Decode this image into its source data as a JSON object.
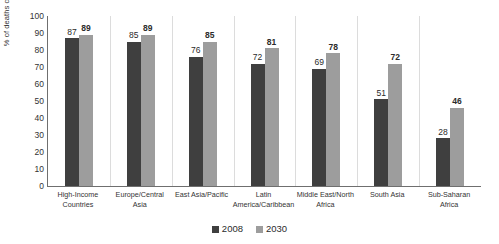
{
  "chart_data": {
    "type": "bar",
    "title": "",
    "subtitle": "",
    "xlabel": "",
    "ylabel": "% of deaths caused by NCDs",
    "ylim": [
      0,
      100
    ],
    "ytick_labels": [
      "100",
      "90",
      "80",
      "70",
      "60",
      "50",
      "40",
      "30",
      "20",
      "10",
      "0"
    ],
    "ytick_values": [
      100,
      90,
      80,
      70,
      60,
      50,
      40,
      30,
      20,
      10,
      0
    ],
    "grid": false,
    "legend_position": "bottom-center",
    "categories": [
      "High-Income Countries",
      "Europe/Central Asia",
      "East Asia/Pacific",
      "Latin America/Caribbean",
      "Middle East/North Africa",
      "South Asia",
      "Sub-Saharan Africa"
    ],
    "category_lines": [
      [
        "High-Income",
        "Countries"
      ],
      [
        "Europe/Central",
        "Asia"
      ],
      [
        "East Asia/Pacific",
        ""
      ],
      [
        "Latin",
        "America/Caribbean"
      ],
      [
        "Middle East/North",
        "Africa"
      ],
      [
        "South Asia",
        ""
      ],
      [
        "Sub-Saharan",
        "Africa"
      ]
    ],
    "series": [
      {
        "name": "2008",
        "color": "#3f3f3f",
        "label_bold": false,
        "values": [
          87,
          85,
          76,
          72,
          69,
          51,
          28
        ]
      },
      {
        "name": "2030",
        "color": "#9d9d9d",
        "label_bold": true,
        "values": [
          89,
          89,
          85,
          81,
          78,
          72,
          46
        ]
      }
    ]
  },
  "legend": {
    "entries": [
      {
        "label": "2008",
        "color": "#3f3f3f"
      },
      {
        "label": "2030",
        "color": "#9d9d9d"
      }
    ]
  }
}
